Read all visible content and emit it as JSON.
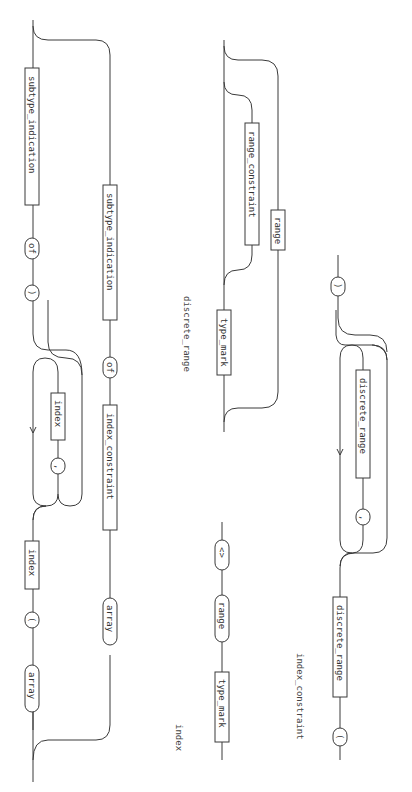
{
  "page": {
    "orientation": "rotated-90-clockwise",
    "ink_color": "#3a3a3a",
    "paper_color": "#ffffff"
  },
  "diagrams": {
    "array_type_definition": {
      "upper_path": {
        "array_kw": "array",
        "lparen": "(",
        "index_box": "index",
        "loop_separator": ",",
        "loop_index_box": "index",
        "rparen": ")",
        "of_kw": "of",
        "subtype_box": "subtype_indication"
      },
      "lower_path": {
        "array_kw": "array",
        "index_constraint_box": "index_constraint",
        "of_kw": "of",
        "subtype_box": "subtype_indication"
      }
    },
    "discrete_range": {
      "title": "discrete_range",
      "type_mark_box": "type_mark",
      "range_constraint_box": "range_constraint",
      "range_box": "range"
    },
    "index": {
      "title": "index",
      "type_mark_box": "type_mark",
      "range_kw": "range",
      "box_kw": "<>"
    },
    "index_constraint": {
      "title": "index_constraint",
      "lparen": "(",
      "discrete_range_box": "discrete_range",
      "loop_separator": ",",
      "loop_discrete_range_box": "discrete_range",
      "rparen": ")"
    }
  }
}
